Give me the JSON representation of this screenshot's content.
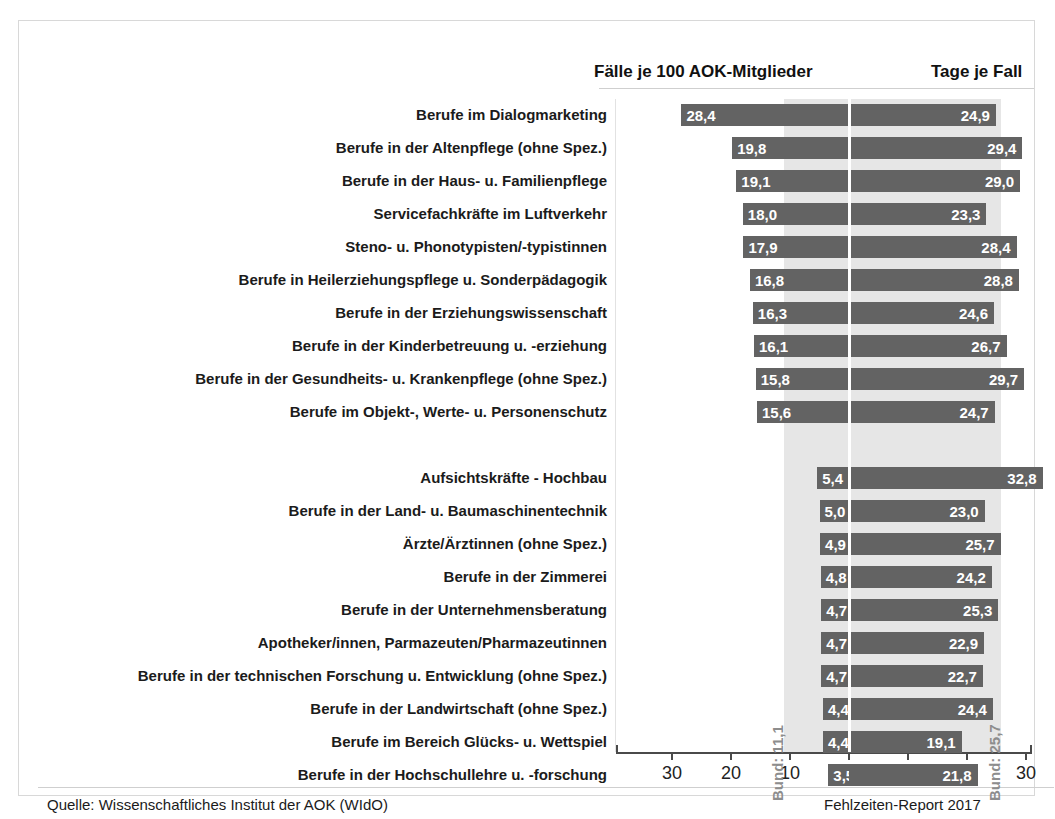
{
  "header": {
    "left_title": "Fälle je 100 AOK-Mitglieder",
    "right_title": "Tage je Fall"
  },
  "footer": {
    "source": "Quelle: Wissenschaftliches Institut der AOK (WIdO)",
    "report": "Fehlzeiten-Report 2017"
  },
  "annotations": {
    "bund_left": "Bund: 11,1",
    "bund_right": "Bund: 25,7"
  },
  "axis": {
    "tick_labels": [
      "30",
      "20",
      "10",
      "0",
      "10",
      "20",
      "30"
    ]
  },
  "colors": {
    "bar": "#636363",
    "band": "#e6e6e6",
    "bar_label": "#ffffff",
    "annotation": "#8d8d8d",
    "axis": "#4a4a4a"
  },
  "chart_data": {
    "type": "bar",
    "title": "",
    "subtitle": "",
    "orientation": "horizontal-diverging",
    "xlabel": "",
    "ylabel": "",
    "xlim_left": [
      0,
      30
    ],
    "xlim_right": [
      0,
      30
    ],
    "grid": false,
    "legend": "none",
    "reference_lines": [
      {
        "name": "Bund",
        "series": "Fälle je 100 AOK-Mitglieder",
        "value": 11.1,
        "label": "Bund: 11,1"
      },
      {
        "name": "Bund",
        "series": "Tage je Fall",
        "value": 25.7,
        "label": "Bund: 25,7"
      }
    ],
    "series": [
      {
        "name": "Fälle je 100 AOK-Mitglieder",
        "side": "left",
        "values": [
          28.4,
          19.8,
          19.1,
          18.0,
          17.9,
          16.8,
          16.3,
          16.1,
          15.8,
          15.6,
          5.4,
          5.0,
          4.9,
          4.8,
          4.7,
          4.7,
          4.7,
          4.4,
          4.4,
          3.5
        ],
        "labels": [
          "28,4",
          "19,8",
          "19,1",
          "18,0",
          "17,9",
          "16,8",
          "16,3",
          "16,1",
          "15,8",
          "15,6",
          "5,4",
          "5,0",
          "4,9",
          "4,8",
          "4,7",
          "4,7",
          "4,7",
          "4,4",
          "4,4",
          "3,5"
        ]
      },
      {
        "name": "Tage je Fall",
        "side": "right",
        "values": [
          24.9,
          29.4,
          29.0,
          23.3,
          28.4,
          28.8,
          24.6,
          26.7,
          29.7,
          24.7,
          32.8,
          23.0,
          25.7,
          24.2,
          25.3,
          22.9,
          22.7,
          24.4,
          19.1,
          21.8
        ],
        "labels": [
          "24,9",
          "29,4",
          "29,0",
          "23,3",
          "28,4",
          "28,8",
          "24,6",
          "26,7",
          "29,7",
          "24,7",
          "32,8",
          "23,0",
          "25,7",
          "24,2",
          "25,3",
          "22,9",
          "22,7",
          "24,4",
          "19,1",
          "21,8"
        ]
      }
    ],
    "categories": [
      "Berufe im Dialogmarketing",
      "Berufe in der Altenpflege (ohne Spez.)",
      "Berufe in der Haus- u. Familienpflege",
      "Servicefachkräfte im Luftverkehr",
      "Steno- u. Phonotypisten/-typistinnen",
      "Berufe in Heilerziehungspflege u. Sonderpädagogik",
      "Berufe in der Erziehungswissenschaft",
      "Berufe in der Kinderbetreuung u. -erziehung",
      "Berufe in der Gesundheits- u. Krankenpflege (ohne Spez.)",
      "Berufe im Objekt-, Werte- u. Personenschutz",
      "Aufsichtskräfte - Hochbau",
      "Berufe in der Land- u. Baumaschinentechnik",
      "Ärzte/Ärztinnen (ohne Spez.)",
      "Berufe in der Zimmerei",
      "Berufe in der Unternehmensberatung",
      "Apotheker/innen, Parmazeuten/Pharmazeutinnen",
      "Berufe in der technischen Forschung u. Entwicklung (ohne Spez.)",
      "Berufe in der Landwirtschaft (ohne Spez.)",
      "Berufe im Bereich Glücks- u. Wettspiel",
      "Berufe in der Hochschullehre u. -forschung"
    ],
    "group_break_after_index": 9
  }
}
